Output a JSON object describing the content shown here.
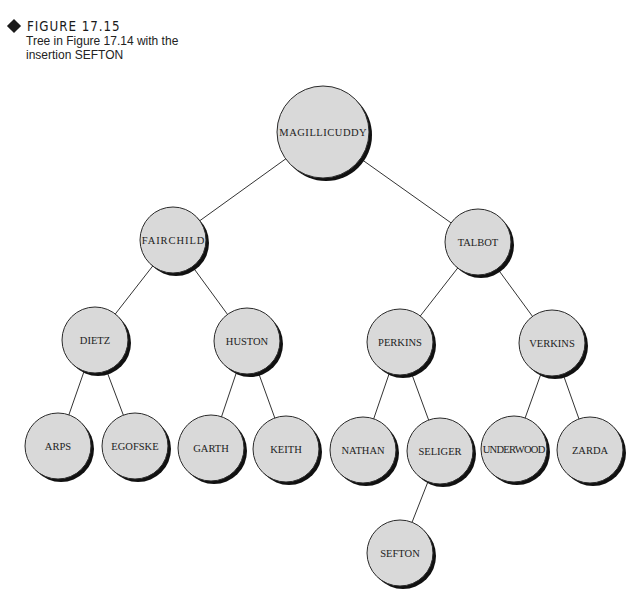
{
  "caption": {
    "figure_label": "FIGURE 17.15",
    "description": "Tree in Figure 17.14 with the insertion SEFTON"
  },
  "colors": {
    "node_fill": "#d9d9d9",
    "node_outline": "#2a2a2a",
    "node_shadow": "#111111",
    "edge": "#333333",
    "text": "#222222"
  },
  "tree": {
    "nodes": [
      {
        "id": "magillicuddy",
        "label": "MAGILLICUDDY",
        "cx": 323,
        "cy": 132,
        "r": 46
      },
      {
        "id": "fairchild",
        "label": "FAIRCHILD",
        "cx": 173,
        "cy": 240,
        "r": 33
      },
      {
        "id": "talbot",
        "label": "TALBOT",
        "cx": 478,
        "cy": 242,
        "r": 33
      },
      {
        "id": "dietz",
        "label": "DIETZ",
        "cx": 95,
        "cy": 340,
        "r": 33
      },
      {
        "id": "huston",
        "label": "HUSTON",
        "cx": 247,
        "cy": 341,
        "r": 33
      },
      {
        "id": "perkins",
        "label": "PERKINS",
        "cx": 400,
        "cy": 342,
        "r": 33
      },
      {
        "id": "verkins",
        "label": "VERKINS",
        "cx": 552,
        "cy": 343,
        "r": 33
      },
      {
        "id": "arps",
        "label": "ARPS",
        "cx": 58,
        "cy": 446,
        "r": 33
      },
      {
        "id": "egofske",
        "label": "EGOFSKE",
        "cx": 135,
        "cy": 446,
        "r": 33
      },
      {
        "id": "garth",
        "label": "GARTH",
        "cx": 211,
        "cy": 448,
        "r": 33
      },
      {
        "id": "keith",
        "label": "KEITH",
        "cx": 286,
        "cy": 449,
        "r": 33
      },
      {
        "id": "nathan",
        "label": "NATHAN",
        "cx": 363,
        "cy": 450,
        "r": 33
      },
      {
        "id": "seliger",
        "label": "SELIGER",
        "cx": 440,
        "cy": 451,
        "r": 33
      },
      {
        "id": "underwood",
        "label": "UNDERWOOD",
        "cx": 514,
        "cy": 449,
        "r": 33
      },
      {
        "id": "zarda",
        "label": "ZARDA",
        "cx": 590,
        "cy": 450,
        "r": 33
      },
      {
        "id": "sefton",
        "label": "SEFTON",
        "cx": 400,
        "cy": 553,
        "r": 33
      }
    ],
    "edges": [
      [
        "magillicuddy",
        "fairchild"
      ],
      [
        "magillicuddy",
        "talbot"
      ],
      [
        "fairchild",
        "dietz"
      ],
      [
        "fairchild",
        "huston"
      ],
      [
        "talbot",
        "perkins"
      ],
      [
        "talbot",
        "verkins"
      ],
      [
        "dietz",
        "arps"
      ],
      [
        "dietz",
        "egofske"
      ],
      [
        "huston",
        "garth"
      ],
      [
        "huston",
        "keith"
      ],
      [
        "perkins",
        "nathan"
      ],
      [
        "perkins",
        "seliger"
      ],
      [
        "verkins",
        "underwood"
      ],
      [
        "verkins",
        "zarda"
      ],
      [
        "seliger",
        "sefton"
      ]
    ]
  }
}
